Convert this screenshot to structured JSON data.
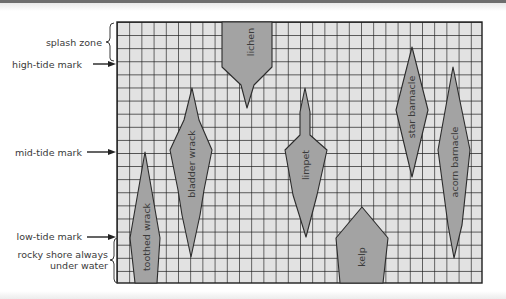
{
  "diagram": {
    "type": "rocky shore zonation",
    "zones": [
      {
        "id": "splash",
        "label": "splash zone",
        "marker": "brace"
      },
      {
        "id": "high",
        "label": "high-tide mark",
        "marker": "arrow"
      },
      {
        "id": "mid",
        "label": "mid-tide mark",
        "marker": "arrow"
      },
      {
        "id": "low",
        "label": "low-tide mark",
        "marker": "arrow"
      },
      {
        "id": "submerged",
        "label_line1": "rocky shore always",
        "label_line2": "under water",
        "marker": "brace"
      }
    ],
    "organisms": [
      {
        "name": "lichen",
        "range": "splash zone to just below high-tide mark"
      },
      {
        "name": "toothed wrack",
        "range": "below mid-tide into always-submerged zone"
      },
      {
        "name": "bladder wrack",
        "range": "between high-tide and low-tide marks"
      },
      {
        "name": "limpet",
        "range": "below high-tide to just above low-tide"
      },
      {
        "name": "kelp",
        "range": "low-tide mark into always-submerged zone"
      },
      {
        "name": "star barnacle",
        "range": "just below splash zone to mid-tide"
      },
      {
        "name": "acorn barnacle",
        "range": "below high-tide to near low-tide"
      }
    ],
    "colors": {
      "grid_fill": "#e2e2e2",
      "grid_line": "#1e1e1e",
      "shape_fill": "#a3a3a3",
      "shape_stroke": "#2b2b2b",
      "text": "#3a3a3a"
    },
    "grid": {
      "columns": 30,
      "rows": 20
    }
  },
  "labels": {
    "splash_zone": "splash zone",
    "high_tide": "high-tide mark",
    "mid_tide": "mid-tide mark",
    "low_tide": "low-tide mark",
    "submerged_1": "rocky shore always",
    "submerged_2": "under water",
    "lichen": "lichen",
    "toothed_wrack": "toothed wrack",
    "bladder_wrack": "bladder wrack",
    "limpet": "limpet",
    "kelp": "kelp",
    "star_barnacle": "star barnacle",
    "acorn_barnacle": "acorn barnacle"
  }
}
